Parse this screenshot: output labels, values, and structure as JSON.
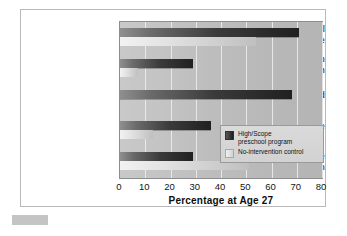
{
  "chart_data": {
    "type": "bar",
    "orientation": "horizontal",
    "title": "",
    "xlabel": "Percentage at Age 27",
    "ylabel": "",
    "xlim": [
      0,
      80
    ],
    "xticks": [
      0,
      10,
      20,
      30,
      40,
      50,
      60,
      70,
      80
    ],
    "grid": true,
    "legend_position": "inside-center-right",
    "categories": [
      "High school graduate",
      "Earning more than $2,000/month",
      "Married",
      "Own own home",
      "Spent time in prison"
    ],
    "category_lines": [
      [
        "High school",
        "graduate"
      ],
      [
        "Earning more than",
        "$2,000/month"
      ],
      [
        "Married"
      ],
      [
        "Own own home"
      ],
      [
        "Spent time",
        "in prison"
      ]
    ],
    "series": [
      {
        "name": "High/Scope preschool program",
        "color": "#202020",
        "values": [
          71,
          29,
          68,
          36,
          29
        ]
      },
      {
        "name": "No-intervention control",
        "color": "#dcdcdc",
        "values": [
          54,
          7,
          0,
          13,
          51
        ]
      }
    ]
  },
  "legend": {
    "items": [
      {
        "label_lines": [
          "High/Scope",
          "preschool program"
        ],
        "swatch": "dark-gradient"
      },
      {
        "label_lines": [
          "No-intervention control"
        ],
        "swatch": "light-gradient"
      }
    ]
  },
  "axis": {
    "x_title": "Percentage at Age 27",
    "tick_labels": [
      "0",
      "10",
      "20",
      "30",
      "40",
      "50",
      "60",
      "70",
      "80"
    ]
  }
}
